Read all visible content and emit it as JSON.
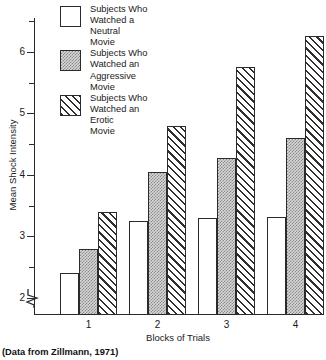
{
  "chart_data": {
    "type": "bar",
    "title": "",
    "xlabel": "Blocks of Trials",
    "ylabel": "Mean Shock Intensity",
    "categories": [
      "1",
      "2",
      "3",
      "4"
    ],
    "ylim": [
      1.72,
      6.55
    ],
    "y_major_ticks": [
      2,
      3,
      4,
      5,
      6
    ],
    "y_minor_ticks": [
      2.5,
      3.5,
      4.5,
      5.5,
      6.5
    ],
    "y_tick_labels": [
      "2",
      "3",
      "4",
      "5",
      "6"
    ],
    "grid": false,
    "legend_position": "top-left",
    "axis_break": true,
    "series": [
      {
        "name": "Subjects Who Watched a Neutral Movie",
        "fill": "white",
        "values": [
          2.4,
          3.25,
          3.3,
          3.32
        ]
      },
      {
        "name": "Subjects Who Watched an Aggressive Movie",
        "fill": "gray-dotted",
        "values": [
          2.8,
          4.05,
          4.28,
          4.6
        ]
      },
      {
        "name": "Subjects Who Watched an Erotic Movie",
        "fill": "diagonal-hatch",
        "values": [
          3.4,
          4.8,
          5.75,
          6.25
        ]
      }
    ]
  },
  "legend": {
    "entries": [
      {
        "label": "Subjects Who\nWatched a\nNeutral\nMovie",
        "swatch": "neutral-swatch"
      },
      {
        "label": "Subjects Who\nWatched an\nAggressive\nMovie",
        "swatch": "aggressive-swatch"
      },
      {
        "label": "Subjects Who\nWatched an\nErotic\nMovie",
        "swatch": "erotic-swatch"
      }
    ]
  },
  "axes": {
    "y_title": "Mean Shock Intensity",
    "x_title": "Blocks of Trials",
    "y_labels": [
      "6",
      "5",
      "4",
      "3",
      "2"
    ],
    "x_labels": [
      "1",
      "2",
      "3",
      "4"
    ]
  },
  "caption": {
    "source": "(Data from Zillmann, 1971)"
  },
  "colors": {
    "axis": "#2a2a2a",
    "bar_outline": "#2b2b2b",
    "neutral_fill": "#ffffff",
    "aggressive_fill": "#d8d8d8",
    "hatch": "#2f2f2f",
    "text": "#1a1a1a",
    "background": "#ffffff"
  }
}
